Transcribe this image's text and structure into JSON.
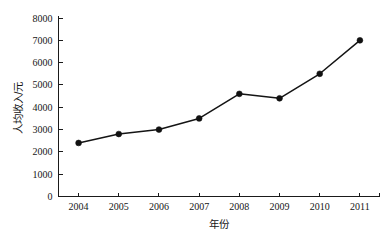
{
  "chart_data": {
    "type": "line",
    "title": "",
    "xlabel": "年份",
    "ylabel": "人均收入/元",
    "categories": [
      "2004",
      "2005",
      "2006",
      "2007",
      "2008",
      "2009",
      "2010",
      "2011"
    ],
    "x": [
      2004,
      2005,
      2006,
      2007,
      2008,
      2009,
      2010,
      2011
    ],
    "values": [
      2400,
      2800,
      3000,
      3500,
      4600,
      4400,
      5500,
      7000
    ],
    "series": [
      {
        "name": "人均收入",
        "values": [
          2400,
          2800,
          3000,
          3500,
          4600,
          4400,
          5500,
          7000
        ]
      }
    ],
    "ylim": [
      0,
      8000
    ],
    "yticks": [
      0,
      1000,
      2000,
      3000,
      4000,
      5000,
      6000,
      7000,
      8000
    ],
    "ytick_labels": [
      "0",
      "1000",
      "2000",
      "3000",
      "4000",
      "5000",
      "6000",
      "7000",
      "8000"
    ],
    "xtick_labels": [
      "2004",
      "2005",
      "2006",
      "2007",
      "2008",
      "2009",
      "2010",
      "2011"
    ],
    "grid": false,
    "legend": false,
    "legend_position": "none",
    "marker": "filled-circle",
    "line_color": "#141414",
    "marker_color": "#111111",
    "background_color": "#ffffff"
  },
  "axes": {
    "y_axis_title": "人均收入/元",
    "x_axis_title": "年份"
  }
}
